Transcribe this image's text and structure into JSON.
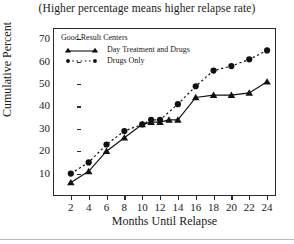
{
  "chart_data": {
    "type": "line",
    "title": "(Higher percentage means higher relapse rate)",
    "xlabel": "Months Until Relapse",
    "ylabel": "Cumulative Percent",
    "xlim": [
      0,
      25
    ],
    "ylim": [
      0,
      75
    ],
    "xticks": [
      2,
      4,
      6,
      8,
      10,
      12,
      14,
      16,
      18,
      20,
      22,
      24
    ],
    "yticks": [
      10,
      20,
      30,
      40,
      50,
      60,
      70
    ],
    "grid": false,
    "legend_position": "top-left",
    "legend_title": "Good Result Centers",
    "series": [
      {
        "name": "Day Treatment and Drugs",
        "style": "solid",
        "marker": "triangle",
        "color": "#111111",
        "x": [
          2,
          4,
          6,
          8,
          10,
          11,
          12,
          13,
          14,
          16,
          18,
          20,
          22,
          24
        ],
        "values": [
          6,
          11,
          20,
          26,
          32,
          33,
          33,
          34,
          34,
          44,
          45,
          45,
          46,
          51
        ]
      },
      {
        "name": "Drugs Only",
        "style": "dotted",
        "marker": "circle",
        "color": "#111111",
        "x": [
          2,
          4,
          6,
          8,
          10,
          11,
          12,
          14,
          16,
          18,
          20,
          22,
          24
        ],
        "values": [
          10,
          15,
          23,
          29,
          32,
          34,
          34,
          41,
          49,
          56,
          58,
          61,
          65
        ]
      }
    ]
  },
  "legend": {
    "heading": "Good Result Centers",
    "entries": [
      {
        "label": "Day Treatment and Drugs"
      },
      {
        "label": "Drugs Only"
      }
    ]
  }
}
